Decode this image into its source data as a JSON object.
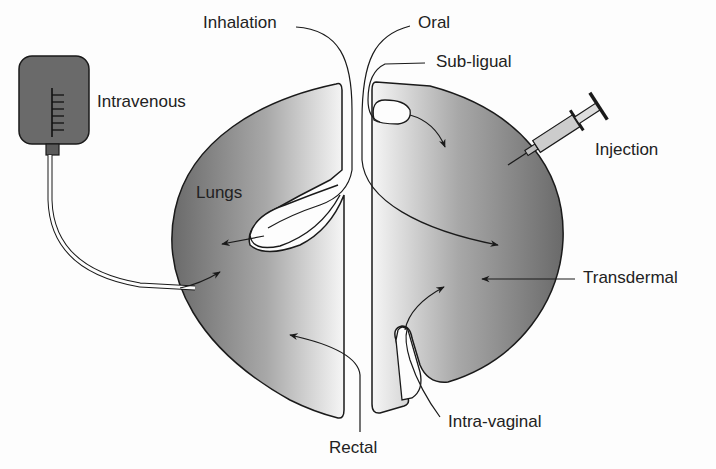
{
  "diagram": {
    "labels": {
      "inhalation": "Inhalation",
      "oral": "Oral",
      "sublingual": "Sub-ligual",
      "intravenous": "Intravenous",
      "injection": "Injection",
      "lungs": "Lungs",
      "transdermal": "Transdermal",
      "intravaginal": "Intra-vaginal",
      "rectal": "Rectal"
    },
    "colors": {
      "body_dark": "#6e6e6e",
      "body_light": "#f4f4f4",
      "outline": "#1a1a1a",
      "iv_bag": "#6a6a6a"
    }
  }
}
